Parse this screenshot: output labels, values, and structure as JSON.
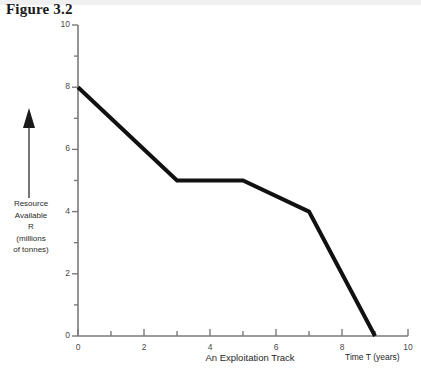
{
  "figure": {
    "title": "Figure 3.2"
  },
  "y_caption_lines": [
    "Resource",
    "Available",
    "R",
    "(millions",
    "of tonnes)"
  ],
  "colors": {
    "line": "#111111",
    "axis": "#7a7a7a",
    "tick_label": "#4a4a4a",
    "title": "#1a1a1a",
    "background": "#ffffff"
  },
  "chart_data": {
    "type": "line",
    "title": "Figure 3.2",
    "subtitle": "An Exploitation Track",
    "xlabel": "Time T (years)",
    "ylabel": "Resource Available R (millions of tonnes)",
    "xlim": [
      0,
      10
    ],
    "ylim": [
      0,
      10
    ],
    "grid": false,
    "legend": "none",
    "x_ticks_major": [
      0,
      2,
      4,
      6,
      8,
      10
    ],
    "x_ticks_minor": [
      1,
      3,
      5,
      7,
      9
    ],
    "y_ticks_major": [
      0,
      2,
      4,
      6,
      8,
      10
    ],
    "y_ticks_minor": [
      1,
      3,
      5,
      7,
      9
    ],
    "x_tick_labels": [
      "0",
      "2",
      "4",
      "6",
      "8",
      "10"
    ],
    "y_tick_labels": [
      "0",
      "2",
      "4",
      "6",
      "8",
      "10"
    ],
    "series": [
      {
        "name": "An Exploitation Track",
        "x": [
          0,
          3,
          5,
          7,
          9
        ],
        "y": [
          8,
          5,
          5,
          4,
          0
        ],
        "points": [
          {
            "x": 0,
            "y": 8
          },
          {
            "x": 3,
            "y": 5
          },
          {
            "x": 5,
            "y": 5
          },
          {
            "x": 7,
            "y": 4
          },
          {
            "x": 9,
            "y": 0
          }
        ],
        "color": "#111111",
        "line_width": 4
      }
    ],
    "annotations": [
      {
        "text": "Resource Available R (millions of tonnes)",
        "role": "y-axis-caption-with-up-arrow"
      },
      {
        "text": "An Exploitation Track",
        "role": "x-axis-center-title"
      },
      {
        "text": "Time T (years)",
        "role": "x-axis-right-unit"
      }
    ]
  }
}
